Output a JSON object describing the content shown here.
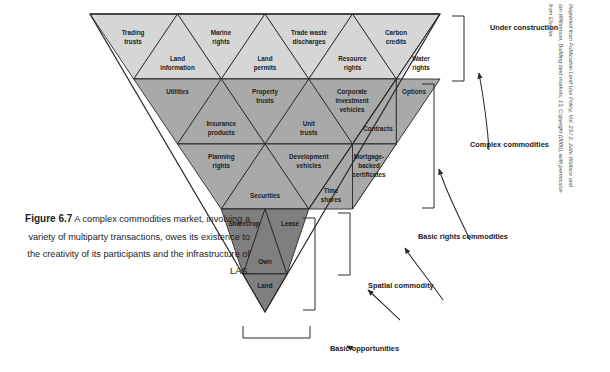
{
  "figure": {
    "caption_label": "Figure 6.7",
    "caption_text": " A complex commodities market, involving a variety of multiparty transactions, owes its existence to the creativity of its participants and the infrastructure of LAS.",
    "credit": "Reprinted from Publication Land Use Policy, Vol. 23 / 2, Jude Wallace and Ian Williamson, Building land markets, 13, Copyright (2006), with permission from Elsevier."
  },
  "colors": {
    "row1_fill": "#d6d6d6",
    "row23_fill": "#a9a9a9",
    "row45_fill": "#7f7f7f",
    "stroke": "#2b2b2b",
    "text": "#1c1c1c"
  },
  "pyramid": {
    "rows": [
      {
        "index": 1,
        "fill_name": "row1_fill",
        "down_cells": [
          "Trading trusts",
          "Marine rights",
          "Trade waste discharges",
          "Carbon credits"
        ],
        "up_cells": [
          "Land information",
          "Land permits",
          "Resource rights",
          "Water rights"
        ]
      },
      {
        "index": 2,
        "fill_name": "row23_fill",
        "down_cells": [
          "Utilities",
          "Property trusts",
          "Corporate investment vehicles",
          "Options"
        ],
        "up_cells": [
          "Insurance products",
          "Unit trusts",
          "Contracts"
        ]
      },
      {
        "index": 3,
        "fill_name": "row23_fill",
        "down_cells": [
          "Planning rights",
          "Development vehicles",
          "Mortgage-backed certificates"
        ],
        "up_cells": [
          "Securities",
          "Time shares"
        ]
      },
      {
        "index": 4,
        "fill_name": "row45_fill",
        "down_cells": [
          "Sharecrop",
          "Lease"
        ],
        "up_cells": [
          "Own"
        ]
      },
      {
        "index": 5,
        "fill_name": "row45_fill",
        "down_cells": [
          "Land"
        ],
        "up_cells": []
      }
    ]
  },
  "annotations": {
    "under_construction": "Under construction",
    "complex_commodities": "Complex commodities",
    "basic_rights_commodities": "Basic rights commodities",
    "spatial_commodity": "Spatial commodity",
    "basic_opportunities": "Basic opportunities"
  }
}
